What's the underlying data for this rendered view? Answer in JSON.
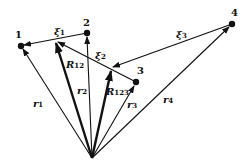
{
  "diagram": {
    "type": "vector-diagram",
    "origin": {
      "x": 92,
      "y": 158
    },
    "points": [
      {
        "id": "p1",
        "label": "1",
        "x": 21,
        "y": 46
      },
      {
        "id": "p2",
        "label": "2",
        "x": 87,
        "y": 33
      },
      {
        "id": "p3",
        "label": "3",
        "x": 136,
        "y": 82
      },
      {
        "id": "p4",
        "label": "4",
        "x": 232,
        "y": 24
      }
    ],
    "labels": {
      "xi1": {
        "sym": "ξ",
        "sub": "1"
      },
      "xi2": {
        "sym": "ξ",
        "sub": "2"
      },
      "xi3": {
        "sym": "ξ",
        "sub": "3"
      },
      "R12": {
        "sym": "R",
        "sub": "12"
      },
      "R123": {
        "sym": "R",
        "sub": "123"
      },
      "r1": {
        "sym": "r",
        "sub": "1"
      },
      "r2": {
        "sym": "r",
        "sub": "2"
      },
      "r3": {
        "sym": "r",
        "sub": "3"
      },
      "r4": {
        "sym": "r",
        "sub": "4"
      }
    }
  }
}
